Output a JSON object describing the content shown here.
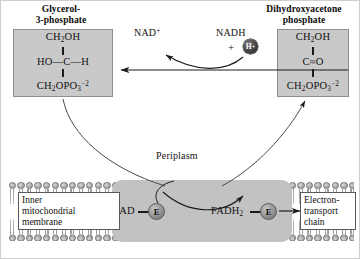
{
  "diagram": {
    "glycerol3p": {
      "title_line1": "Glycerol-",
      "title_line2": "3-phosphate",
      "formula_top": "CH2OH",
      "formula_mid": "HO—C—H",
      "formula_bottom": "CH2OPO3-2"
    },
    "dhap": {
      "title_line1": "Dihydroxyacetone",
      "title_line2": "phosphate",
      "formula_top": "CH2OH",
      "formula_mid": "C═O",
      "formula_bottom": "CH2OPO3-2"
    },
    "cofactors": {
      "nad_plus": "NAD",
      "nad_plus_charge": "+",
      "nadh": "NADH",
      "plus_sign": "+",
      "proton": "H",
      "proton_charge": "+"
    },
    "membrane": {
      "periplasm_label": "Periplasm",
      "inner_membrane_line1": "Inner",
      "inner_membrane_line2": "mitochondrial",
      "inner_membrane_line3": "membrane",
      "etc_line1": "Electron-",
      "etc_line2": "transport",
      "etc_line3": "chain"
    },
    "enzyme": {
      "fad_label": "FAD",
      "fadh2_label": "FADH",
      "fadh2_subscript": "2",
      "enzyme_symbol_left": "E",
      "enzyme_symbol_right": "E"
    },
    "colors": {
      "box_fill": "#c9c9c9",
      "enzyme_fill": "#c2c2c2",
      "lipid_head": "#b4b4b4",
      "stroke": "#1a1a1a",
      "page_background": "#ffffff"
    }
  }
}
